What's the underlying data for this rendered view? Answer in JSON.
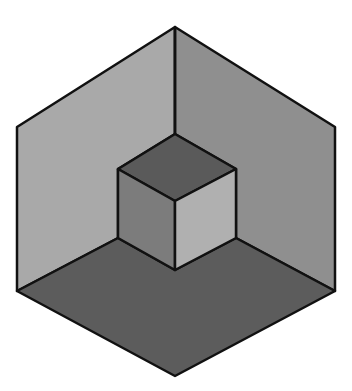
{
  "figure": {
    "colors": {
      "left_wall": "#a9a9a9",
      "right_wall": "#8f8f8f",
      "floor": "#5c5c5c",
      "cube_top": "#5a5a5a",
      "cube_left": "#7c7c7c",
      "cube_right": "#b0b0b0",
      "outline": "#111111"
    }
  }
}
